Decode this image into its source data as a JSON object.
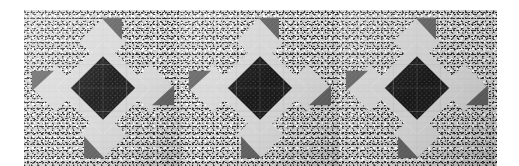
{
  "page": {
    "width": 519,
    "height": 166,
    "background": "#ffffff",
    "alt": "Photograph of a quilted table runner with three identical eight-pointed star blocks"
  },
  "photo": {
    "name": "quilt-runner-photo",
    "left": 24,
    "top": 10,
    "width": 473,
    "height": 156,
    "background_fabric": {
      "label": "speckled black-and-white background fabric",
      "base_color": "#cfcfcf",
      "fleck_dark": "#1e1e1e",
      "fleck_light": "#f6f6f6"
    }
  },
  "palette": {
    "center_dark": "#141414",
    "star_light": "#d9d9d9",
    "star_light_alt": "#d2d2d2",
    "accent_gray": "#5d5d5d",
    "background_gray": "#cfcfcf",
    "page_white": "#ffffff"
  },
  "blocks": [
    {
      "name": "star-block-1",
      "left": 0,
      "width": 158,
      "label": "Star block 1"
    },
    {
      "name": "star-block-2",
      "left": 157,
      "width": 158,
      "label": "Star block 2"
    },
    {
      "name": "star-block-3",
      "left": 314,
      "width": 158,
      "label": "Star block 3"
    }
  ],
  "block_parts": {
    "center_diamond": "center square-on-point patch, dark print",
    "star_points": "four light square-on-point arms forming the star body",
    "accent_triangles": "four medium-gray corner triangles at north, east, south, west",
    "corner_wedges": "light wedge patches at the four diagonal corners"
  }
}
